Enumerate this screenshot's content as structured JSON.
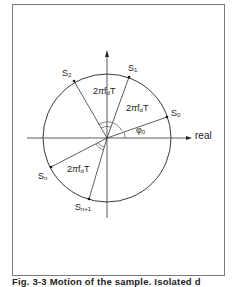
{
  "figure": {
    "axis_label_real": "real",
    "points": {
      "s0": {
        "main": "S",
        "sub": "0"
      },
      "s1": {
        "main": "S",
        "sub": "1"
      },
      "s2": {
        "main": "S",
        "sub": "2"
      },
      "sn": {
        "main": "S",
        "sub": "n"
      },
      "sn1": {
        "main": "S",
        "sub": "n+1"
      }
    },
    "angle_labels": {
      "upper": {
        "pre": "2",
        "pi": "π",
        "f": "f",
        "sub": "d",
        "post": "T"
      },
      "right": {
        "pre": "2",
        "pi": "π",
        "f": "f",
        "sub": "d",
        "post": "T"
      },
      "lower": {
        "pre": "2",
        "pi": "π",
        "f": "f",
        "sub": "d",
        "post": "T"
      }
    },
    "phase_label": {
      "main": "φ",
      "sub": "0"
    }
  },
  "caption": "Fig. 3-3  Motion of the sample. Isolated d"
}
